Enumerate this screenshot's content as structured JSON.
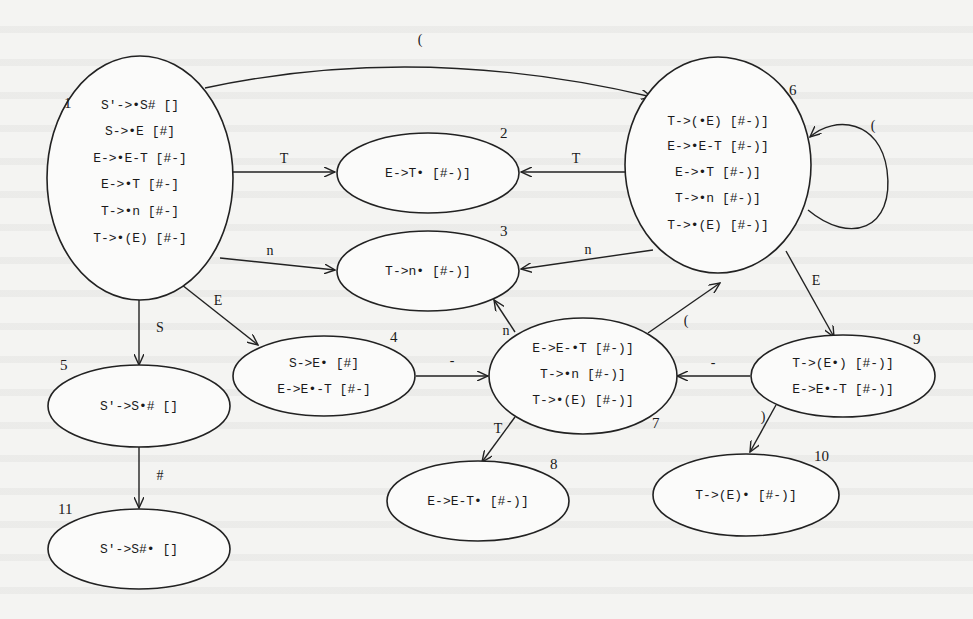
{
  "diagram": {
    "states": [
      {
        "id": "1",
        "items": [
          "S′->•S#  []",
          "S->•E  [#]",
          "E->•E-T  [#-]",
          "E->•T  [#-]",
          "T->•n  [#-]",
          "T->•(E)  [#-]"
        ]
      },
      {
        "id": "2",
        "items": [
          "E->T•  [#-)]"
        ]
      },
      {
        "id": "3",
        "items": [
          "T->n•  [#-)]"
        ]
      },
      {
        "id": "4",
        "items": [
          "S->E•  [#]",
          "E->E•-T  [#-]"
        ]
      },
      {
        "id": "5",
        "items": [
          "S′->S•#  []"
        ]
      },
      {
        "id": "6",
        "items": [
          "T->(•E)  [#-)]",
          "E->•E-T  [#-)]",
          "E->•T  [#-)]",
          "T->•n  [#-)]",
          "T->•(E)  [#-)]"
        ]
      },
      {
        "id": "7",
        "items": [
          "E->E-•T  [#-)]",
          "T->•n  [#-)]",
          "T->•(E)  [#-)]"
        ]
      },
      {
        "id": "8",
        "items": [
          "E->E-T•  [#-)]"
        ]
      },
      {
        "id": "9",
        "items": [
          "T->(E•)  [#-)]",
          "E->E•-T  [#-)]"
        ]
      },
      {
        "id": "10",
        "items": [
          "T->(E)•  [#-)]"
        ]
      },
      {
        "id": "11",
        "items": [
          "S′->S#•  []"
        ]
      }
    ],
    "edges": [
      {
        "from": "1",
        "to": "6",
        "label": "("
      },
      {
        "from": "1",
        "to": "2",
        "label": "T"
      },
      {
        "from": "1",
        "to": "3",
        "label": "n"
      },
      {
        "from": "1",
        "to": "4",
        "label": "E"
      },
      {
        "from": "1",
        "to": "5",
        "label": "S"
      },
      {
        "from": "5",
        "to": "11",
        "label": "#"
      },
      {
        "from": "6",
        "to": "2",
        "label": "T"
      },
      {
        "from": "6",
        "to": "3",
        "label": "n"
      },
      {
        "from": "6",
        "to": "6",
        "label": "("
      },
      {
        "from": "6",
        "to": "9",
        "label": "E"
      },
      {
        "from": "4",
        "to": "7",
        "label": "-"
      },
      {
        "from": "7",
        "to": "3",
        "label": "n"
      },
      {
        "from": "7",
        "to": "6",
        "label": "("
      },
      {
        "from": "7",
        "to": "8",
        "label": "T"
      },
      {
        "from": "9",
        "to": "7",
        "label": "-"
      },
      {
        "from": "9",
        "to": "10",
        "label": ")"
      }
    ]
  }
}
